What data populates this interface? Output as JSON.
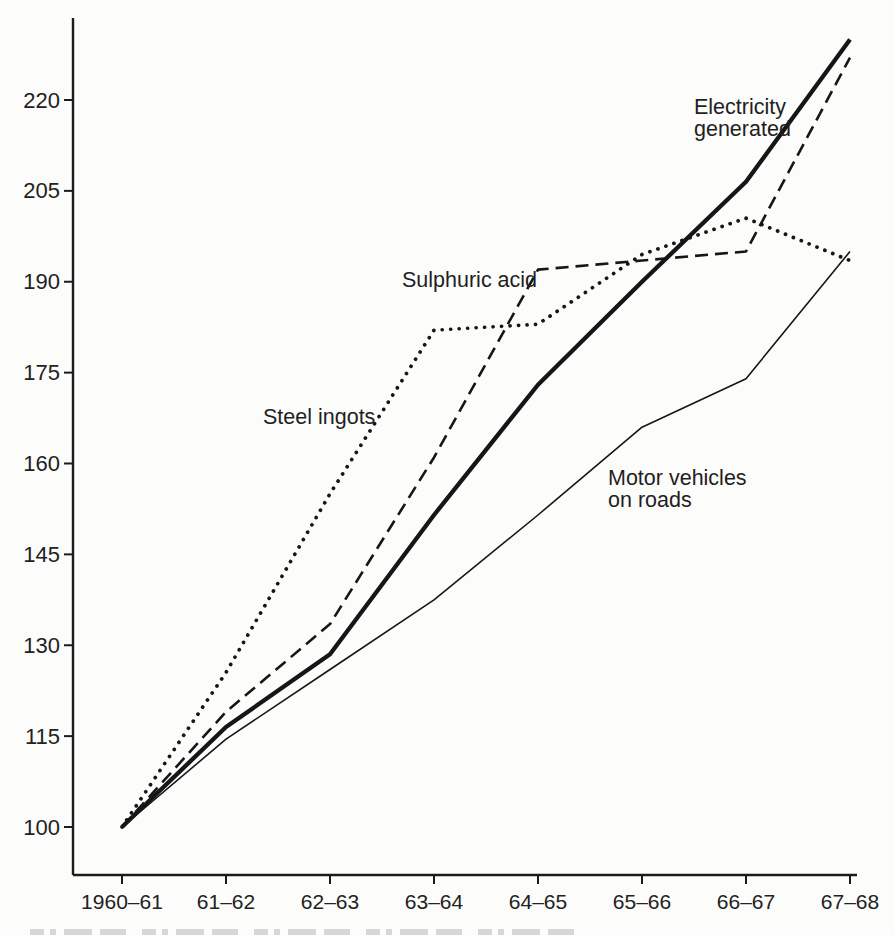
{
  "page": {
    "paper_color": "#fcfcfb",
    "ink_color": "#1c1c1c"
  },
  "chart_data": {
    "type": "line",
    "title": "",
    "xlabel": "",
    "ylabel": "",
    "grid": false,
    "legend": "inline-annotations",
    "categories": [
      "1960–61",
      "61–62",
      "62–63",
      "63–64",
      "64–65",
      "65–66",
      "66–67",
      "67–68"
    ],
    "y_ticks": [
      100,
      115,
      130,
      145,
      160,
      175,
      190,
      205,
      220
    ],
    "ylim": [
      93,
      233
    ],
    "series": [
      {
        "name": "Motor vehicles on roads",
        "style": "solid-thin",
        "values": [
          100,
          114.5,
          126,
          137.5,
          151.5,
          166,
          174,
          195
        ]
      },
      {
        "name": "Steel ingots",
        "style": "dotted",
        "values": [
          100,
          125.5,
          155,
          182,
          183,
          194.5,
          200.5,
          193.5
        ]
      },
      {
        "name": "Sulphuric acid",
        "style": "long-dash",
        "values": [
          100,
          119,
          133.5,
          161,
          192,
          193.5,
          195,
          227
        ]
      },
      {
        "name": "Electricity generated",
        "style": "solid-thick",
        "values": [
          100,
          116.5,
          128.5,
          151.5,
          173,
          190,
          206.5,
          230
        ]
      }
    ],
    "annotations": [
      {
        "series": "Electricity generated",
        "lines": [
          "Electricity",
          "generated"
        ],
        "x": 694,
        "y": 114,
        "line_height": 22
      },
      {
        "series": "Sulphuric acid",
        "lines": [
          "Sulphuric acid"
        ],
        "x": 402,
        "y": 287,
        "line_height": 22
      },
      {
        "series": "Steel ingots",
        "lines": [
          "Steel ingots"
        ],
        "x": 263,
        "y": 424,
        "line_height": 22
      },
      {
        "series": "Motor vehicles on roads",
        "lines": [
          "Motor vehicles",
          "on roads"
        ],
        "x": 608,
        "y": 485,
        "line_height": 22
      }
    ],
    "plot": {
      "x0": 122,
      "x_step": 104,
      "y_at_100": 827,
      "y_at_220": 100,
      "axis_x": 73,
      "axis_top": 18,
      "axis_y": 875,
      "axis_right": 857,
      "tick_len": 9,
      "y_label_x": 60,
      "x_label_y": 909
    }
  }
}
